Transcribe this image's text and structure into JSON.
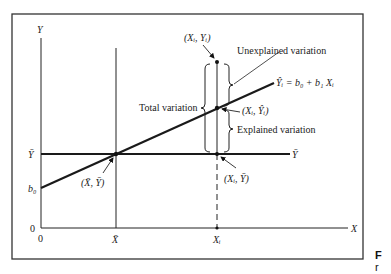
{
  "diagram": {
    "axes": {
      "y_label": "Y",
      "x_label": "X",
      "origin_x": "0",
      "origin_y": "0",
      "y_bar_tick": "Ȳ",
      "b0_tick": "b₀",
      "x_bar_tick": "X̄",
      "xi_tick": "Xᵢ"
    },
    "labels": {
      "point_observed": "(Xᵢ, Yᵢ)",
      "point_predicted": "(Xᵢ, Ŷᵢ)",
      "point_mean": "(X̄, Ȳ)",
      "point_xi_ybar": "(Xᵢ, Ȳ)",
      "regression_eq": "Ŷᵢ = b₀ + b₁ Xᵢ",
      "mean_line": "Ȳ",
      "unexplained": "Unexplained variation",
      "explained": "Explained variation",
      "total": "Total variation"
    },
    "colors": {
      "line": "#1a1a1a",
      "frame": "#333333",
      "background": "#ffffff"
    }
  },
  "side_caption": {
    "line1": "F",
    "line2": "r"
  }
}
